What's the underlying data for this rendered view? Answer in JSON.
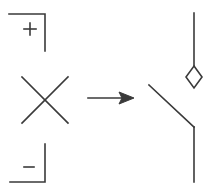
{
  "diagram": {
    "left": {
      "top_terminal": {
        "label": "+"
      },
      "crossing": {
        "symbol": "cross"
      },
      "bottom_terminal": {
        "label": "–"
      }
    },
    "arrow": {
      "direction": "right"
    },
    "right": {
      "switch": {
        "type": "open-switch",
        "contact_shape": "diamond"
      }
    },
    "colors": {
      "stroke": "#3a3a3a",
      "background": "#ffffff"
    }
  }
}
